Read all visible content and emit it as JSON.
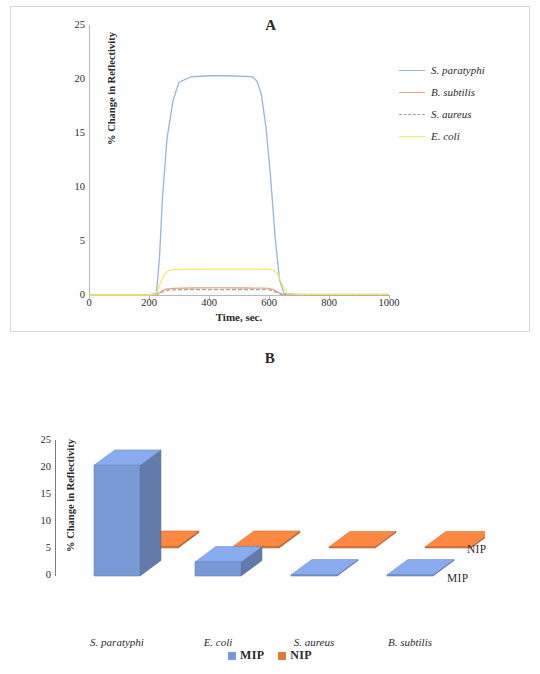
{
  "figure": {
    "panel_a_label": "A",
    "panel_b_label": "B"
  },
  "chart_data": [
    {
      "type": "line",
      "panel": "A",
      "title": "A",
      "xlabel": "Time, sec.",
      "ylabel": "% Change in Reflectivity",
      "xlim": [
        0,
        1000
      ],
      "ylim": [
        0,
        25
      ],
      "xticks": [
        "0",
        "200",
        "400",
        "600",
        "800",
        "1000"
      ],
      "yticks": [
        "0",
        "5",
        "10",
        "15",
        "20",
        "25"
      ],
      "grid": false,
      "legend_position": "right",
      "series": [
        {
          "name": "S. paratyphi",
          "color": "#9ab3dd",
          "dash": "none",
          "plateau": 20.3,
          "x": [
            0,
            120,
            200,
            225,
            235,
            245,
            260,
            280,
            300,
            340,
            400,
            460,
            520,
            545,
            560,
            575,
            590,
            605,
            620,
            635,
            650,
            700,
            800,
            900,
            1000
          ],
          "y": [
            0,
            0,
            0,
            0.2,
            3.5,
            9.0,
            14.5,
            18.0,
            19.7,
            20.2,
            20.3,
            20.3,
            20.25,
            20.2,
            19.8,
            18.5,
            15.5,
            11.0,
            5.5,
            1.4,
            0.15,
            0.05,
            0.05,
            0.05,
            0.05
          ]
        },
        {
          "name": "B. subtilis",
          "color": "#e8a87c",
          "dash": "none",
          "plateau": 0.65,
          "x": [
            0,
            200,
            225,
            240,
            255,
            280,
            340,
            400,
            460,
            520,
            575,
            600,
            615,
            630,
            645,
            700,
            800,
            900,
            1000
          ],
          "y": [
            0,
            0,
            0.05,
            0.3,
            0.55,
            0.62,
            0.65,
            0.66,
            0.66,
            0.65,
            0.64,
            0.62,
            0.5,
            0.25,
            0.05,
            0.03,
            0.03,
            0.03,
            0.03
          ]
        },
        {
          "name": "S. aureus",
          "color": "#a6a6a6",
          "dash": "dashed",
          "plateau": 0.5,
          "x": [
            0,
            200,
            225,
            240,
            255,
            280,
            340,
            400,
            460,
            520,
            575,
            600,
            615,
            630,
            645,
            700,
            800,
            900,
            1000
          ],
          "y": [
            0,
            0,
            0.03,
            0.22,
            0.42,
            0.48,
            0.5,
            0.5,
            0.5,
            0.5,
            0.49,
            0.47,
            0.38,
            0.18,
            0.03,
            0.02,
            0.02,
            0.02,
            0.02
          ]
        },
        {
          "name": "E. coli",
          "color": "#f2e96b",
          "dash": "none",
          "plateau": 2.35,
          "x": [
            0,
            200,
            225,
            235,
            250,
            265,
            285,
            320,
            400,
            480,
            560,
            600,
            615,
            630,
            645,
            660,
            700,
            800,
            900,
            1000
          ],
          "y": [
            0,
            0,
            0.1,
            0.9,
            1.9,
            2.25,
            2.35,
            2.38,
            2.4,
            2.4,
            2.4,
            2.38,
            2.3,
            1.9,
            0.9,
            0.1,
            0.05,
            0.05,
            0.05,
            0.05
          ]
        }
      ]
    },
    {
      "type": "bar",
      "panel": "B",
      "title": "B",
      "xlabel": "",
      "ylabel": "% Change in Reflectivity",
      "ylim": [
        0,
        25
      ],
      "yticks": [
        "0",
        "5",
        "10",
        "15",
        "20",
        "25"
      ],
      "categories": [
        "S. paratyphi",
        "E. coli",
        "S. aureus",
        "B. subtilis"
      ],
      "grid": false,
      "legend_position": "bottom",
      "row_labels": {
        "front": "MIP",
        "back": "NIP"
      },
      "series": [
        {
          "name": "MIP",
          "color": "#7a9ad6",
          "values": [
            20.5,
            2.6,
            0.2,
            0.2
          ]
        },
        {
          "name": "NIP",
          "color": "#e2793a",
          "values": [
            0.3,
            0.3,
            0.2,
            0.2
          ]
        }
      ],
      "legend": [
        "MIP",
        "NIP"
      ]
    }
  ],
  "panel_a": {
    "title": "A",
    "xlabel": "Time, sec.",
    "ylabel": "% Change in Reflectivity",
    "xticks": [
      "0",
      "200",
      "400",
      "600",
      "800",
      "1000"
    ],
    "yticks": [
      "0",
      "5",
      "10",
      "15",
      "20",
      "25"
    ],
    "legend": [
      {
        "label": "S. paratyphi",
        "color": "#9ab3dd",
        "style": "solid"
      },
      {
        "label": "B. subtilis",
        "color": "#e8a87c",
        "style": "solid"
      },
      {
        "label": "S. aureus",
        "color": "#a6a6a6",
        "style": "dashed"
      },
      {
        "label": "E. coli",
        "color": "#f2e96b",
        "style": "solid"
      }
    ]
  },
  "panel_b": {
    "title": "B",
    "ylabel": "% Change in Reflectivity",
    "yticks": [
      "0",
      "5",
      "10",
      "15",
      "20",
      "25"
    ],
    "categories": [
      "S. paratyphi",
      "E. coli",
      "S. aureus",
      "B. subtilis"
    ],
    "series_labels": {
      "front": "MIP",
      "back": "NIP"
    },
    "legend": [
      {
        "label": "MIP",
        "color": "#7a9ad6"
      },
      {
        "label": "NIP",
        "color": "#e2793a"
      }
    ]
  }
}
